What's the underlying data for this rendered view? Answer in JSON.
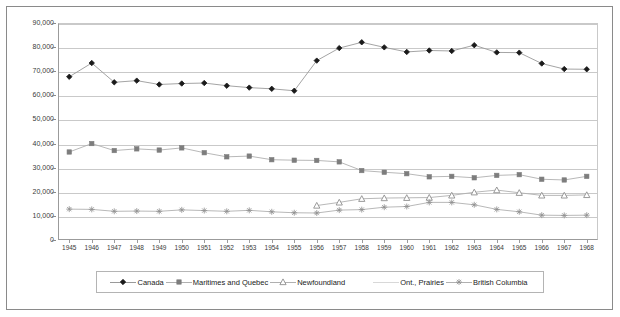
{
  "chart_data": {
    "type": "line",
    "title": "",
    "subtitle": "",
    "xlabel": "",
    "ylabel": "",
    "grid": true,
    "legend_position": "bottom",
    "ylim": [
      0,
      90000
    ],
    "yticks": [
      "0",
      "10,000",
      "20,000",
      "30,000",
      "40,000",
      "50,000",
      "60,000",
      "70,000",
      "80,000",
      "90,000"
    ],
    "ytick_values": [
      0,
      10000,
      20000,
      30000,
      40000,
      50000,
      60000,
      70000,
      80000,
      90000
    ],
    "categories": [
      "1945",
      "1946",
      "1947",
      "1948",
      "1949",
      "1950",
      "1951",
      "1952",
      "1953",
      "1954",
      "1955",
      "1956",
      "1957",
      "1958",
      "1959",
      "1960",
      "1961",
      "1962",
      "1963",
      "1964",
      "1965",
      "1966",
      "1967",
      "1968"
    ],
    "series": [
      {
        "name": "Canada",
        "marker": "diamond",
        "color": "#1a1a1a",
        "line_color": "#9a9a9a",
        "values": [
          67700,
          73400,
          65400,
          66100,
          64500,
          64900,
          65100,
          64000,
          63200,
          62700,
          61900,
          74400,
          79600,
          82000,
          79900,
          78000,
          78600,
          78400,
          80800,
          77800,
          77700,
          73200,
          70900,
          70800
        ]
      },
      {
        "name": "Maritimes and Quebec",
        "marker": "square",
        "color": "#7d7d7d",
        "line_color": "#b0b0b0",
        "values": [
          36500,
          40000,
          37100,
          37800,
          37300,
          38200,
          36200,
          34500,
          34800,
          33300,
          33100,
          33000,
          32400,
          28800,
          28100,
          27500,
          26200,
          26400,
          25800,
          26800,
          27100,
          25200,
          24900,
          26400
        ]
      },
      {
        "name": "Newfoundland",
        "marker": "triangle",
        "color": "#8f8f8f",
        "line_color": "#b0b0b0",
        "values": [
          null,
          null,
          null,
          null,
          null,
          null,
          null,
          null,
          null,
          null,
          null,
          14300,
          15600,
          17100,
          17400,
          17500,
          17600,
          18500,
          19800,
          20700,
          19600,
          18500,
          18500,
          18700
        ]
      },
      {
        "name": "Ont., Prairies",
        "marker": "none",
        "color": "#9a9a9a",
        "line_color": "#b0b0b0",
        "values": [
          null,
          null,
          null,
          null,
          null,
          null,
          null,
          null,
          null,
          null,
          null,
          null,
          null,
          null,
          null,
          null,
          null,
          null,
          null,
          null,
          null,
          null,
          null,
          null
        ]
      },
      {
        "name": "British Columbia",
        "marker": "asterisk",
        "color": "#8f8f8f",
        "line_color": "#b0b0b0",
        "values": [
          12800,
          12700,
          11900,
          12000,
          11900,
          12500,
          12200,
          11900,
          12300,
          11700,
          11300,
          11200,
          12400,
          12600,
          13600,
          13900,
          15600,
          15600,
          14600,
          12700,
          11700,
          10300,
          10200,
          10300
        ]
      }
    ]
  },
  "legend": {
    "items": [
      {
        "label": "Canada",
        "marker": "diamond"
      },
      {
        "label": "Maritimes and Quebec",
        "marker": "square"
      },
      {
        "label": "Newfoundland",
        "marker": "triangle"
      },
      {
        "label": "Ont., Prairies",
        "marker": "none"
      },
      {
        "label": "British Columbia",
        "marker": "asterisk"
      }
    ]
  }
}
